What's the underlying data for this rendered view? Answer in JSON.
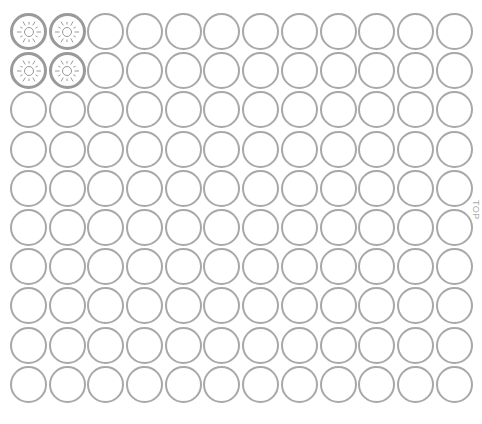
{
  "board": {
    "rows": 10,
    "cols": 12,
    "lit_cells": [
      [
        0,
        0
      ],
      [
        0,
        1
      ],
      [
        1,
        0
      ],
      [
        1,
        1
      ]
    ],
    "lit_icon": "sun-icon",
    "ring_color": "#a8a8a8",
    "icon_color": "#999999"
  },
  "side_label": "TOP"
}
